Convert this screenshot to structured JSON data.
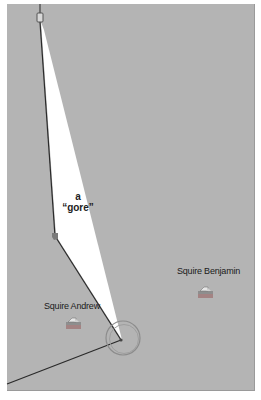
{
  "map": {
    "background": "#b4b4b4",
    "gore_fill": "#ffffff",
    "line_color": "#2a2a2a"
  },
  "annotations": {
    "gore_line1": "a",
    "gore_line2": "“gore”"
  },
  "markers": [
    {
      "label": "Squire Andrew",
      "icon": "house-parcel-icon"
    },
    {
      "label": "Squire Benjamin",
      "icon": "house-parcel-icon"
    }
  ],
  "features": {
    "top_marker": "boundary-marker-icon",
    "vertex": "vertex-point-icon",
    "corner_circle": "survey-circle-icon"
  }
}
